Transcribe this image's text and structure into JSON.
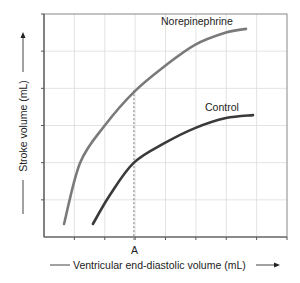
{
  "chart_data": {
    "type": "line",
    "title": "",
    "xlabel": "Ventricular end-diastolic volume (mL)",
    "ylabel": "Stroke volume (mL)",
    "xlim": [
      0,
      8
    ],
    "ylim": [
      0,
      6
    ],
    "grid": true,
    "x_ticks": [
      1,
      2,
      3,
      4,
      5,
      6,
      7
    ],
    "y_ticks": [
      1,
      2,
      3,
      4,
      5
    ],
    "x_tick_labels": {
      "3": "A"
    },
    "annotations": [
      {
        "type": "vline-dashed",
        "x": 2.96,
        "label": "A"
      },
      {
        "type": "label",
        "text": "Norepinephrine",
        "x": 3.85,
        "y": 6.0
      },
      {
        "type": "label",
        "text": "Control",
        "x": 5.3,
        "y": 3.45
      }
    ],
    "series": [
      {
        "name": "Norepinephrine",
        "color": "#7a7a7a",
        "points": [
          [
            0.66,
            0.35
          ],
          [
            1.19,
            2.0
          ],
          [
            2.0,
            3.0
          ],
          [
            2.96,
            3.9
          ],
          [
            3.98,
            4.6
          ],
          [
            4.97,
            5.17
          ],
          [
            5.99,
            5.5
          ],
          [
            6.65,
            5.6
          ]
        ]
      },
      {
        "name": "Control",
        "color": "#3a3a3a",
        "points": [
          [
            1.61,
            0.35
          ],
          [
            2.17,
            1.13
          ],
          [
            2.96,
            2.0
          ],
          [
            3.98,
            2.53
          ],
          [
            4.97,
            2.93
          ],
          [
            5.99,
            3.2
          ],
          [
            6.88,
            3.28
          ]
        ]
      }
    ]
  },
  "labels": {
    "norepinephrine": "Norepinephrine",
    "control": "Control",
    "point_a": "A",
    "x_axis": "Ventricular end-diastolic volume (mL)",
    "y_axis": "Stroke volume (mL)"
  },
  "colors": {
    "grid": "#dcdcdc",
    "axis": "#555555",
    "border": "#888888",
    "text": "#222222"
  }
}
